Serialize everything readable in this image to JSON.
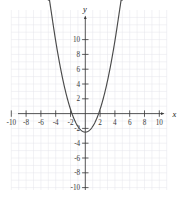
{
  "figure": {
    "title": "",
    "x_axis_label": "x",
    "y_axis_label": "y",
    "background_color": "#ffffff",
    "grid_color": "#e2e2e8",
    "axis_color": "#3a3a3a",
    "curve_color": "#4a4a4a",
    "label_color": "#3a3a3a"
  },
  "chart_data": {
    "type": "line",
    "title": "",
    "xlabel": "x",
    "ylabel": "y",
    "xlim": [
      -11.5,
      11.5
    ],
    "ylim": [
      -11.5,
      12.5
    ],
    "grid": true,
    "legend": null,
    "x_ticks": [
      -10,
      -8,
      -6,
      -4,
      -2,
      2,
      4,
      6,
      8,
      10
    ],
    "y_ticks": [
      -10,
      -8,
      -6,
      -4,
      -2,
      2,
      4,
      6,
      8,
      10
    ],
    "x_tick_labels": [
      "-10",
      "-8",
      "-6",
      "-4",
      "-2",
      "2",
      "4",
      "6",
      "8",
      "10"
    ],
    "y_tick_labels": [
      "-10",
      "-8",
      "-6",
      "-4",
      "-2",
      "2",
      "4",
      "6",
      "8",
      "10"
    ],
    "series": [
      {
        "name": "parabola",
        "kind": "quadratic",
        "equation": "y = 0.77x^2 - 2.5",
        "vertex": [
          0,
          -2.5
        ],
        "opens": "up",
        "a": 0.77,
        "x_intercepts": [
          -1.8,
          1.8
        ],
        "y_intercept": -2.5,
        "arrow_ends": [
          [
            -4.35,
            11.1
          ],
          [
            4.35,
            11.1
          ]
        ],
        "x": [
          -4.35,
          -4.0,
          -3.5,
          -3.0,
          -2.5,
          -2.0,
          -1.5,
          -1.0,
          -0.5,
          0,
          0.5,
          1.0,
          1.5,
          2.0,
          2.5,
          3.0,
          3.5,
          4.0,
          4.35
        ],
        "values": [
          11.1,
          9.8,
          6.9,
          4.4,
          2.3,
          0.6,
          -0.8,
          -1.7,
          -2.3,
          -2.5,
          -2.3,
          -1.7,
          -0.8,
          0.6,
          2.3,
          4.4,
          6.9,
          9.8,
          11.1
        ]
      }
    ]
  }
}
